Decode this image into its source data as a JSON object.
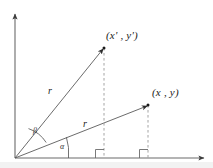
{
  "figure": {
    "background_color": "#ffffff",
    "stroke_color": "#4d4d4d",
    "text_color": "#1a1a1a",
    "width": 213,
    "height": 168,
    "axes": {
      "origin": {
        "x": 15,
        "y": 158
      },
      "y_axis_top": {
        "x": 15,
        "y": 12
      },
      "x_axis_right": {
        "x": 207,
        "y": 158
      },
      "arrowheads": true
    },
    "points": [
      {
        "id": "rotated-point",
        "label": "(x' , y')",
        "x": 104,
        "y": 48,
        "label_x": 106,
        "label_y": 30,
        "radius_label": "r",
        "radius_label_x": 48,
        "radius_label_y": 86
      },
      {
        "id": "original-point",
        "label": "(x , y)",
        "x": 148,
        "y": 105,
        "label_x": 152,
        "label_y": 87,
        "radius_label": "r",
        "radius_label_x": 83,
        "radius_label_y": 119
      }
    ],
    "angles": [
      {
        "id": "beta",
        "label": "β",
        "label_x": 33,
        "label_y": 127,
        "description": "angle between the original ray and the rotated ray"
      },
      {
        "id": "alpha",
        "label": "α",
        "label_x": 60,
        "label_y": 143,
        "description": "angle between the x-axis and the original ray"
      }
    ],
    "right_angle_markers": [
      {
        "x": 104,
        "y": 158
      },
      {
        "x": 148,
        "y": 158
      }
    ],
    "dashed_drop_lines": [
      {
        "from_x": 104,
        "from_y": 48,
        "to_x": 104,
        "to_y": 158
      },
      {
        "from_x": 148,
        "from_y": 105,
        "to_x": 148,
        "to_y": 158
      }
    ]
  }
}
